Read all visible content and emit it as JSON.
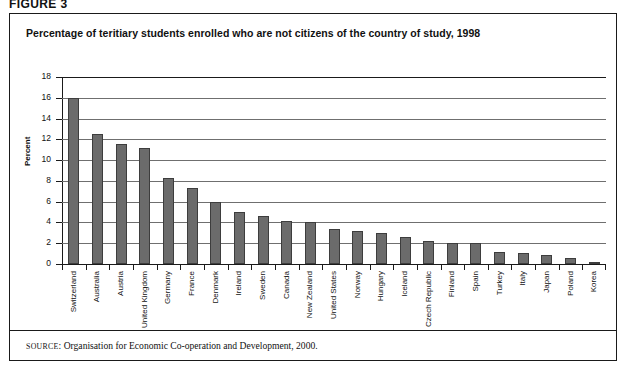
{
  "figure": {
    "label": "FIGURE 3"
  },
  "panel": {
    "title": "Percentage of teritiary students enrolled who are not citizens of the country of study, 1998",
    "source_prefix": "SOURCE",
    "source_text": ": Organisation for Economic Co-operation and Development, 2000."
  },
  "chart_data": {
    "type": "bar",
    "title": "Percentage of teritiary students enrolled who are not citizens of the country of study, 1998",
    "xlabel": "",
    "ylabel": "Percent",
    "ylim": [
      0,
      18
    ],
    "yticks": [
      0,
      2,
      4,
      6,
      8,
      10,
      12,
      14,
      16,
      18
    ],
    "grid": true,
    "legend": "none",
    "bar_color": "#6b6b6b",
    "bar_edge_color": "#3d3d3d",
    "categories": [
      "Switzerland",
      "Australia",
      "Austria",
      "United Kingdom",
      "Germany",
      "France",
      "Denmark",
      "Ireland",
      "Sweden",
      "Canada",
      "New Zealand",
      "United States",
      "Norway",
      "Hungary",
      "Iceland",
      "Czech Republic",
      "Finland",
      "Spain",
      "Turkey",
      "Italy",
      "Japan",
      "Poland",
      "Korea"
    ],
    "values": [
      16.0,
      12.5,
      11.6,
      11.2,
      8.3,
      7.3,
      6.0,
      5.0,
      4.6,
      4.1,
      4.0,
      3.4,
      3.2,
      3.0,
      2.6,
      2.2,
      2.0,
      2.0,
      1.2,
      1.1,
      0.9,
      0.6,
      0.2
    ]
  }
}
